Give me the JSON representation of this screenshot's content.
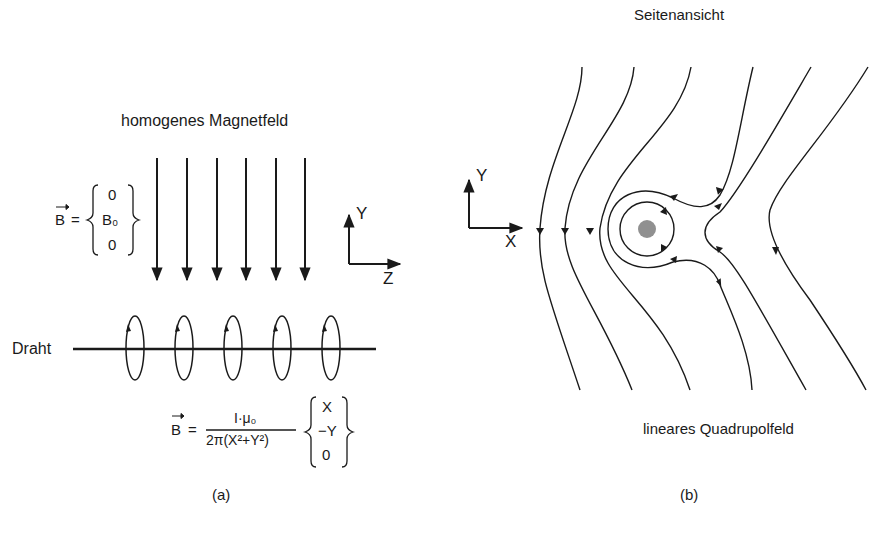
{
  "panel_a": {
    "title": "homogenes Magnetfeld",
    "formula_homogeneous": {
      "lhs": "B",
      "equals": "=",
      "vector": [
        "0",
        "B₀",
        "0"
      ]
    },
    "axes": {
      "vertical": "Y",
      "horizontal": "Z"
    },
    "wire_label": "Draht",
    "formula_wire": {
      "lhs": "B",
      "equals": "=",
      "numerator": "I·μ₀",
      "denominator": "2π(X²+Y²)",
      "vector": [
        "X",
        "−Y",
        "0"
      ]
    },
    "caption": "(a)",
    "field_arrow_count": 6,
    "loop_count": 5
  },
  "panel_b": {
    "title": "Seitenansicht",
    "axes": {
      "vertical": "Y",
      "horizontal": "X"
    },
    "subtitle": "lineares Quadrupolfeld",
    "caption": "(b)"
  }
}
